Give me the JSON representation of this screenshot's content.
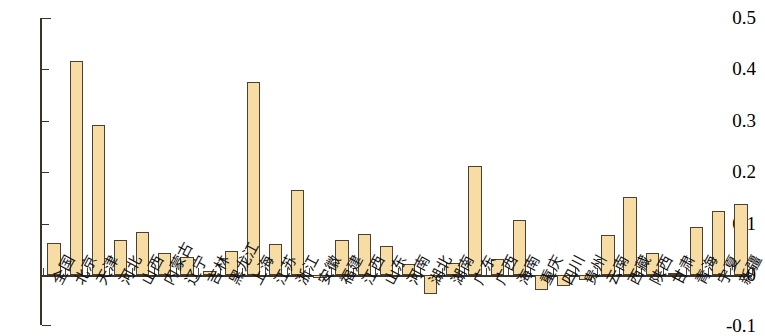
{
  "chart_data": {
    "type": "bar",
    "title": "",
    "subtitle": "",
    "xlabel": "",
    "ylabel": "",
    "ylim": [
      -0.1,
      0.5
    ],
    "ytick_labels": [
      "0.5",
      "0.4",
      "0.3",
      "0.2",
      "0.1",
      "0",
      "-0.1"
    ],
    "ytick_values": [
      0.5,
      0.4,
      0.3,
      0.2,
      0.1,
      0,
      -0.1
    ],
    "grid": false,
    "legend": null,
    "bar_fill_color": "#f7dda4",
    "bar_border_color": "#4a4033",
    "axis_color": "#3a3326",
    "categories": [
      "全国",
      "北京",
      "天津",
      "河北",
      "山西",
      "内蒙古",
      "辽宁",
      "吉林",
      "黑龙江",
      "上海",
      "江苏",
      "浙江",
      "安徽",
      "福建",
      "江西",
      "山东",
      "河南",
      "湖北",
      "湖南",
      "广东",
      "广西",
      "海南",
      "重庆",
      "四川",
      "贵州",
      "云南",
      "西藏",
      "陕西",
      "甘肃",
      "青海",
      "宁夏",
      "新疆"
    ],
    "values": [
      0.062,
      0.417,
      0.291,
      0.068,
      0.084,
      0.042,
      0.035,
      0.007,
      0.046,
      0.375,
      0.06,
      0.165,
      -0.006,
      0.068,
      0.08,
      0.056,
      0.021,
      -0.036,
      0.023,
      0.212,
      0.031,
      0.107,
      -0.03,
      -0.022,
      -0.009,
      0.077,
      0.151,
      0.042,
      0.004,
      0.093,
      0.124,
      0.138
    ]
  }
}
